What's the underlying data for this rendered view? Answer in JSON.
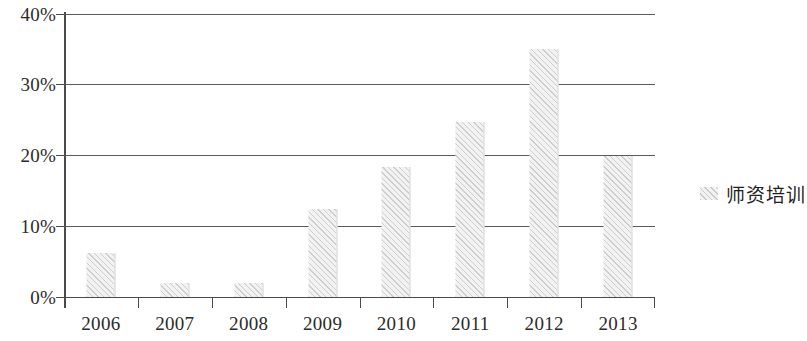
{
  "chart_data": {
    "type": "bar",
    "title": "",
    "subtitle": "",
    "xlabel": "",
    "ylabel": "",
    "categories": [
      "2006",
      "2007",
      "2008",
      "2009",
      "2010",
      "2011",
      "2012",
      "2013"
    ],
    "series": [
      {
        "name": "师资培训",
        "values": [
          6.2,
          2.0,
          2.0,
          12.4,
          18.4,
          24.8,
          35.0,
          20.0
        ]
      }
    ],
    "values": [
      6.2,
      2.0,
      2.0,
      12.4,
      18.4,
      24.8,
      35.0,
      20.0
    ],
    "ylim": [
      0,
      40
    ],
    "ytick_values": [
      0,
      10,
      20,
      30,
      40
    ],
    "ytick_labels": [
      "0%",
      "10%",
      "20%",
      "30%",
      "40%"
    ],
    "grid": true,
    "grid_axis": "y",
    "legend_position": "right",
    "bar_fill": "#f2f2f2",
    "bar_hatch": "diagonal-lines",
    "grid_color": "#5a5a5a",
    "axis_color": "#4a4a4a",
    "text_color": "#2b2b2b",
    "background": "#ffffff"
  },
  "legend": {
    "entries": [
      {
        "label": "师资培训",
        "swatch": "hatched-gray-swatch"
      }
    ]
  }
}
